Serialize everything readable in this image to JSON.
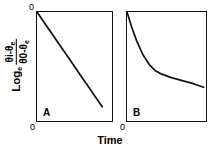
{
  "figure": {
    "xlabel": "Time",
    "ylabel_log": "Log",
    "ylabel_log_sub": "e",
    "ylabel_numerator_main": "θi-θ",
    "ylabel_numerator_sub": "e",
    "ylabel_denominator_main": "θ0-θ",
    "ylabel_denominator_sub": "e",
    "origin_label_a_top": "0",
    "origin_label_a": "0",
    "origin_label_b": "0",
    "panel_a_letter": "A",
    "panel_b_letter": "B",
    "line_color": "#111111",
    "frame_color": "#111111",
    "background_color": "#ffffff"
  },
  "chart_data": [
    {
      "type": "line",
      "title": "A",
      "xlabel": "Time",
      "ylabel": "Log_e (θi-θe)/(θ0-θe)",
      "xlim": [
        0,
        1
      ],
      "ylim": [
        -1,
        0
      ],
      "grid": false,
      "legend": false,
      "annotation": "Single straight line: constant-slope exponential decay (pure first-order / Newtonian cooling)",
      "series": [
        {
          "name": "linear decay",
          "x": [
            0.0,
            0.1,
            0.2,
            0.3,
            0.4,
            0.5,
            0.6,
            0.7,
            0.8,
            0.87
          ],
          "y": [
            0.0,
            -0.1,
            -0.2,
            -0.3,
            -0.4,
            -0.5,
            -0.6,
            -0.7,
            -0.8,
            -0.87
          ]
        }
      ]
    },
    {
      "type": "line",
      "title": "B",
      "xlabel": "Time",
      "ylabel": "Log_e (θi-θe)/(θ0-θe)",
      "xlim": [
        0,
        1
      ],
      "ylim": [
        -1,
        0
      ],
      "grid": false,
      "legend": false,
      "annotation": "Bi-phasic curve: steep initial fall flattening to a shallow tail (two-stage decay)",
      "series": [
        {
          "name": "two-phase decay",
          "x": [
            0.0,
            0.06,
            0.12,
            0.2,
            0.28,
            0.36,
            0.44,
            0.55,
            0.7,
            0.85,
            0.97
          ],
          "y": [
            0.0,
            -0.14,
            -0.26,
            -0.39,
            -0.48,
            -0.54,
            -0.57,
            -0.6,
            -0.63,
            -0.66,
            -0.69
          ]
        }
      ]
    }
  ]
}
